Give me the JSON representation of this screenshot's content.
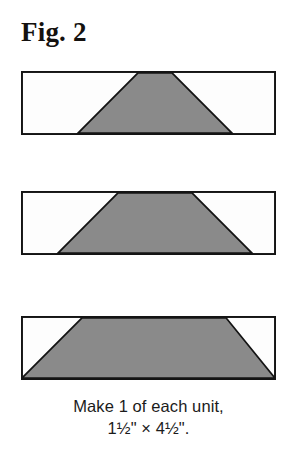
{
  "figure": {
    "title": "Fig. 2",
    "caption_line_1": "Make 1 of each unit,",
    "caption_line_2": "1½\" × 4½\"."
  },
  "colors": {
    "background": "#ffffff",
    "patch_gray": "#8a8a8a",
    "patch_white": "#fdfdfd",
    "outline": "#141414",
    "text": "#14110f"
  },
  "chart_data": {
    "type": "diagram",
    "title": "Fig. 2",
    "subtitle": "Make 1 of each unit, 1½\" × 4½\".",
    "unit_width_in": 4.5,
    "unit_height_in": 1.5,
    "quantity_each": 1,
    "rect": {
      "width_px": 255,
      "height_px": 64
    },
    "units": [
      {
        "name": "unit-1",
        "label": "Unit 1",
        "shape": "symmetric trapezoid, steepest sides",
        "top_left_px": 117,
        "top_right_px": 151,
        "bottom_left_px": 57,
        "bottom_right_px": 211,
        "fill": "#8a8a8a",
        "background_fill": "#fdfdfd"
      },
      {
        "name": "unit-2",
        "label": "Unit 2",
        "shape": "symmetric trapezoid, medium sides",
        "top_left_px": 97,
        "top_right_px": 171,
        "bottom_left_px": 37,
        "bottom_right_px": 231,
        "fill": "#8a8a8a",
        "background_fill": "#fdfdfd"
      },
      {
        "name": "unit-3",
        "label": "Unit 3",
        "shape": "symmetric trapezoid, shallowest sides",
        "top_left_px": 61,
        "top_right_px": 205,
        "bottom_left_px": 0,
        "bottom_right_px": 255,
        "fill": "#8a8a8a",
        "background_fill": "#fdfdfd"
      }
    ],
    "xlabel": "",
    "ylabel": "",
    "legend": []
  }
}
